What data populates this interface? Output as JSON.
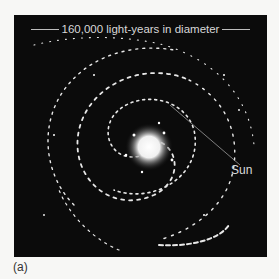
{
  "figure": {
    "title": "160,000 light-years in diameter",
    "pointer_label": "Sun",
    "panel_label": "(a)",
    "background_color": "#0b0b0b",
    "page_color": "#f7f7f5",
    "star_color": "#ffffff"
  }
}
